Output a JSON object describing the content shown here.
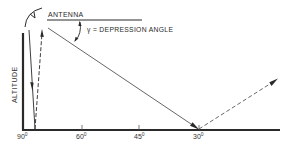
{
  "diagram": {
    "labels": {
      "antenna": "ANTENNA",
      "depression_angle": "γ = DEPRESSION ANGLE",
      "y_axis": "ALTITUDE"
    },
    "x_ticks": [
      {
        "value": "90",
        "unit": "0"
      },
      {
        "value": "60",
        "unit": "0"
      },
      {
        "value": "45",
        "unit": "0"
      },
      {
        "value": "30",
        "unit": "0"
      }
    ],
    "colors": {
      "line": "#2a2a2a",
      "background": "#ffffff"
    }
  }
}
